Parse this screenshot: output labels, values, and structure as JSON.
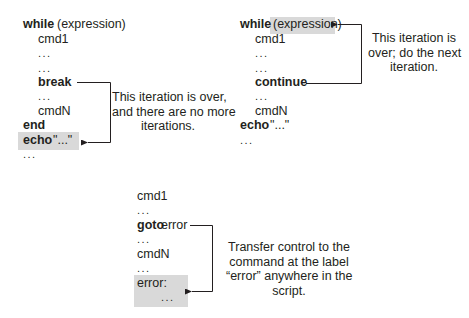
{
  "panels": {
    "break": {
      "lines": [
        "while",
        "(expression)",
        "cmd1",
        "...",
        "...",
        "break",
        "...",
        "cmdN",
        "end",
        "echo",
        "\"...\"",
        "..."
      ],
      "note": [
        "This iteration is over,",
        "and there are no more",
        "iterations."
      ],
      "highlighted": "echo \"...\""
    },
    "continue": {
      "lines": [
        "while",
        "(expression)",
        "cmd1",
        "...",
        "...",
        "continue",
        "...",
        "cmdN",
        "echo",
        "\"...\"",
        "..."
      ],
      "note": [
        "This iteration is",
        "over; do the next",
        "iteration."
      ],
      "highlighted": "(expression)"
    },
    "goto": {
      "lines": [
        "cmd1",
        "...",
        "goto",
        "error",
        "...",
        "cmdN",
        "...",
        "error:",
        "..."
      ],
      "note": [
        "Transfer control to the",
        "command at the label",
        "“error” anywhere in the",
        "script."
      ],
      "highlighted": "error: ..."
    }
  },
  "colors": {
    "text": "#231f20",
    "highlight": "#d9d9d9",
    "line": "#231f20"
  }
}
